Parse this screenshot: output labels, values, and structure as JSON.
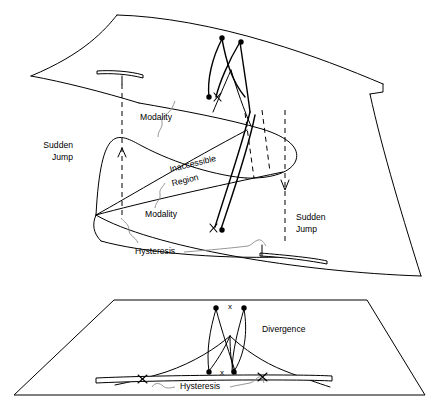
{
  "figure": {
    "background_color": "#ffffff",
    "line_color": "#000000",
    "leader_color": "#8a8a8a"
  },
  "upper_panel": {
    "name": "catastrophe-manifold",
    "labels": {
      "sudden_jump_left_line1": "Sudden",
      "sudden_jump_left_line2": "Jump",
      "sudden_jump_right_line1": "Sudden",
      "sudden_jump_right_line2": "Jump",
      "modality_upper": "Modality",
      "modality_lower": "Modality",
      "inaccessible_line1": "Inaccessible",
      "inaccessible_line2": "Region",
      "hysteresis": "Hysteresis"
    },
    "markers": {
      "x_upper": "x",
      "x_lower": "x"
    }
  },
  "lower_panel": {
    "name": "control-plane",
    "labels": {
      "divergence": "Divergence",
      "hysteresis": "Hysteresis"
    },
    "markers": {
      "x_top": "x",
      "x_bottom": "x"
    }
  }
}
